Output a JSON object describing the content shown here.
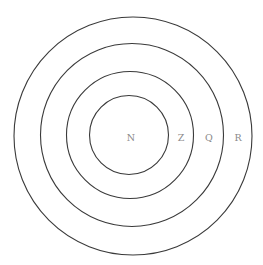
{
  "diagram": {
    "type": "concentric-circles",
    "rings": [
      {
        "id": "inner",
        "label": "N"
      },
      {
        "id": "second",
        "label": "Z"
      },
      {
        "id": "third",
        "label": "Q"
      },
      {
        "id": "outer",
        "label": "R"
      }
    ],
    "colors": {
      "stroke": "#3a3a3a",
      "label": "#8a8a8a",
      "background": "#ffffff"
    }
  }
}
